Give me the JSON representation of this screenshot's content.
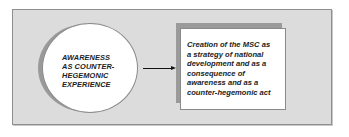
{
  "diagram": {
    "source_node": {
      "shape": "ellipse",
      "lines": [
        "AWARENESS",
        "AS COUNTER-",
        "HEGEMONIC",
        "EXPERIENCE"
      ]
    },
    "edge": {
      "from": "source_node",
      "to": "target_node",
      "type": "arrow"
    },
    "target_node": {
      "shape": "rectangle",
      "lines": [
        "Creation of the MSC as",
        "a strategy of national",
        "development and as a",
        "consequence of",
        "awareness and as a",
        "counter-hegemonic act"
      ]
    },
    "colors": {
      "frame_fill": "#dcdcdc",
      "node_fill": "#ffffff",
      "shadow": "#9a9a9a",
      "text": "#222222"
    }
  }
}
